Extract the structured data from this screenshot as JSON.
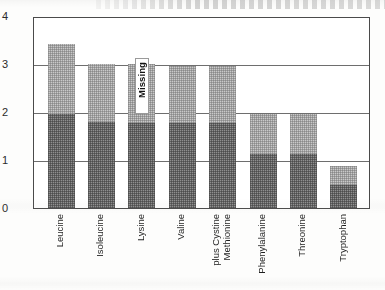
{
  "chart_data": {
    "type": "bar",
    "title": "",
    "subtitle": "",
    "xlabel": "",
    "ylabel": "",
    "ylim": [
      0,
      4
    ],
    "yticks": [
      0,
      1,
      2,
      3,
      4
    ],
    "ytick_labels": [
      "0",
      "1",
      "2",
      "3",
      "4"
    ],
    "grid": "horizontal gridlines at 1, 2 and 3",
    "legend": "none",
    "stacked": true,
    "categories": [
      "Leucine",
      "Isoleucine",
      "Lysine",
      "Valine",
      "Methionine plus Cystine",
      "Phenylalanine",
      "Threonine",
      "Tryptophan"
    ],
    "category_label_lines": [
      [
        "Leucine"
      ],
      [
        "Isoleucine"
      ],
      [
        "Lysine"
      ],
      [
        "Valine"
      ],
      [
        "Methionine",
        "plus Cystine"
      ],
      [
        "Phenylalanine"
      ],
      [
        "Threonine"
      ],
      [
        "Tryptophan"
      ]
    ],
    "series": [
      {
        "name": "dark-segment",
        "color": "#8f8f8f",
        "values": [
          1.95,
          1.8,
          1.78,
          1.78,
          1.78,
          1.12,
          1.13,
          0.48
        ]
      },
      {
        "name": "light-segment",
        "color": "#c9c9c9",
        "values": [
          1.47,
          1.2,
          1.22,
          1.18,
          1.18,
          0.83,
          0.82,
          0.4
        ]
      }
    ],
    "totals": [
      3.42,
      3.0,
      3.0,
      2.96,
      2.96,
      1.95,
      1.95,
      0.88
    ],
    "annotations": [
      {
        "text": "Missing",
        "category": "Lysine",
        "orientation": "vertical",
        "value_range": [
          1.95,
          3.0
        ]
      }
    ]
  },
  "axis": {
    "y_labels": [
      "4",
      "3",
      "2",
      "1",
      "0"
    ]
  }
}
